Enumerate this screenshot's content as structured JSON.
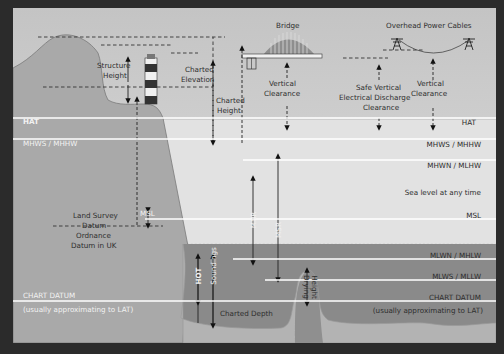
{
  "colors": {
    "background": "#2b2b2b",
    "sky": "#d9d9d9",
    "upper_water": "#e3e3e3",
    "sea": "#8a8a8a",
    "land": "#a6a6a6",
    "seabed": "#b6b6b6",
    "level_line": "#ffffff"
  },
  "structures": {
    "bridge": "Bridge",
    "power_cables": "Overhead Power Cables",
    "bench_mark": "Bench Mark",
    "structure_height": [
      "Structure",
      "Height"
    ],
    "charted_elevation": [
      "Charted",
      "Elevation"
    ],
    "charted_height": [
      "Charted",
      "Height"
    ],
    "bridge_clearance": [
      "Vertical",
      "Clearance"
    ],
    "safe_clearance": [
      "Safe Vertical",
      "Electrical Discharge",
      "Clearance"
    ],
    "cable_clearance": [
      "Vertical",
      "Clearance"
    ]
  },
  "levels_left": {
    "hat": "HAT",
    "mhws": "MHWS / MHHW",
    "msl": "MSL",
    "land_survey": [
      "Land Survey",
      "Datum"
    ],
    "ordnance": [
      "Ordnance",
      "Datum in UK"
    ],
    "chart_datum": "CHART DATUM",
    "chart_datum_note": "(usually approximating to LAT)"
  },
  "levels_right": {
    "hat": "HAT",
    "mhws": "MHWS / MHHW",
    "mhwn": "MHWN / MLHW",
    "sea_level": "Sea level at any time",
    "msl": "MSL",
    "mlwn": "MLWN / MHLW",
    "mlws": "MLWS / MLLW",
    "chart_datum": "CHART DATUM",
    "chart_datum_note": "(usually approximating to LAT)"
  },
  "vertical_labels": {
    "hot": "HOT",
    "soundings": "Soundings",
    "mnr": "MNR",
    "msr": "MSR",
    "drying_height": [
      "Drying",
      "Height"
    ]
  },
  "charted_depth": "Charted Depth"
}
